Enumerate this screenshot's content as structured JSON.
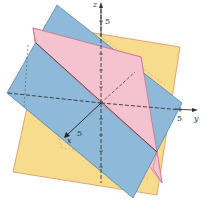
{
  "figure": {
    "axes": {
      "x": {
        "label": "x",
        "tick_label": "5"
      },
      "y": {
        "label": "y",
        "tick_label": "5"
      },
      "z": {
        "label": "z",
        "tick_label": "5"
      }
    },
    "planes": [
      {
        "name": "yellow-plane",
        "color": "#f7dc8e"
      },
      {
        "name": "pink-plane",
        "color": "#f5c3d0"
      },
      {
        "name": "blue-plane",
        "color": "#8fb9d9"
      }
    ]
  }
}
